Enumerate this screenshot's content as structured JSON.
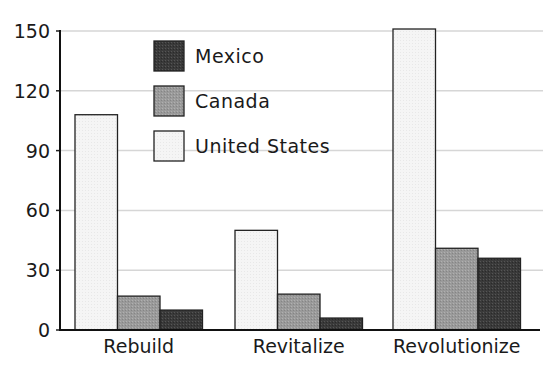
{
  "chart_data": {
    "type": "bar",
    "title": "",
    "xlabel": "",
    "ylabel": "",
    "categories": [
      "Rebuild",
      "Revitalize",
      "Revolutionize"
    ],
    "series": [
      {
        "name": "United States",
        "values": [
          108,
          50,
          151
        ],
        "color": "#f4f4f4"
      },
      {
        "name": "Canada",
        "values": [
          17,
          18,
          41
        ],
        "color": "#9a9a9a"
      },
      {
        "name": "Mexico",
        "values": [
          10,
          6,
          36
        ],
        "color": "#3a3a3a"
      }
    ],
    "ylim": [
      0,
      150
    ],
    "yticks": [
      0,
      30,
      60,
      90,
      120,
      150
    ],
    "grid": true,
    "legend": {
      "position": "upper-left-inside",
      "entries": [
        "Mexico",
        "Canada",
        "United States"
      ]
    }
  }
}
